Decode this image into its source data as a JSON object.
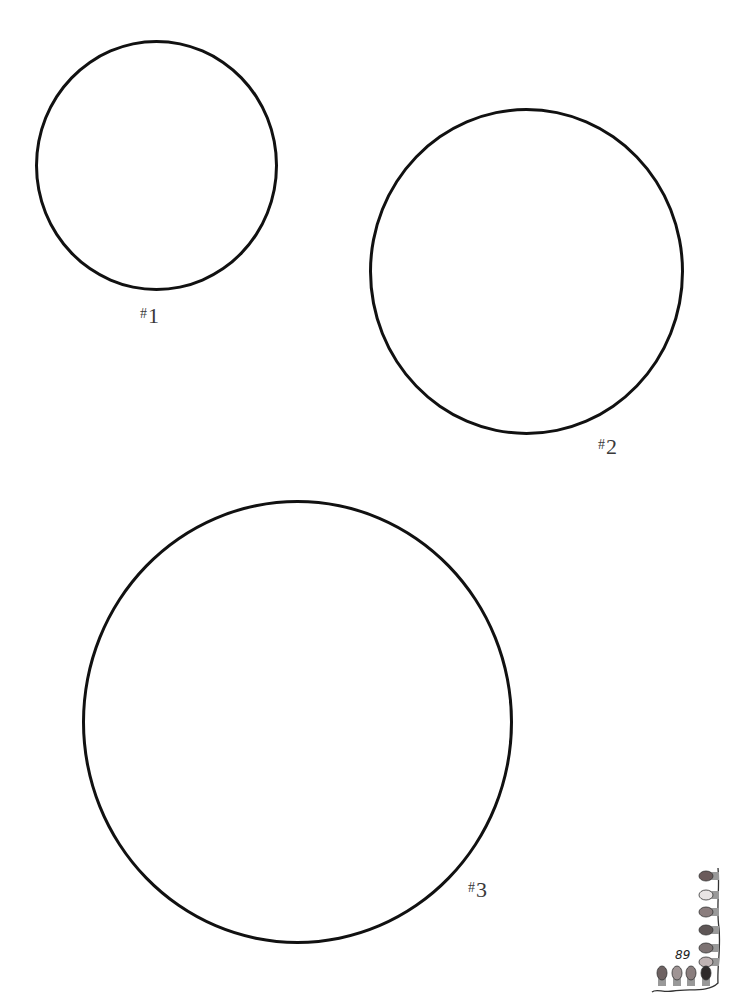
{
  "page": {
    "number": "89",
    "background": "#ffffff"
  },
  "circles": [
    {
      "id": "1",
      "label_prefix": "#",
      "label_number": "1",
      "left": 35,
      "top": 40,
      "width": 243,
      "height": 251,
      "label_left": 140,
      "label_top": 305
    },
    {
      "id": "2",
      "label_prefix": "#",
      "label_number": "2",
      "left": 369,
      "top": 108,
      "width": 315,
      "height": 327,
      "label_left": 598,
      "label_top": 436
    },
    {
      "id": "3",
      "label_prefix": "#",
      "label_number": "3",
      "left": 82,
      "top": 500,
      "width": 431,
      "height": 444,
      "label_left": 468,
      "label_top": 879
    }
  ],
  "decoration": {
    "type": "string-of-lights-garland",
    "bulb_colors": [
      "#6b5b5b",
      "#e8e4e4",
      "#8a7d7d",
      "#5e5656",
      "#7d7373",
      "#bfb3b3",
      "#6e6262",
      "#9f9494",
      "#8a7e7e",
      "#2e2a2a"
    ],
    "wire_color": "#333333"
  }
}
